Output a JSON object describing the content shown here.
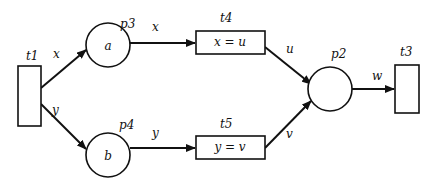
{
  "diagram": {
    "type": "petri-net",
    "transitions": {
      "t1": {
        "label": "t1",
        "guard": ""
      },
      "t3": {
        "label": "t3",
        "guard": ""
      },
      "t4": {
        "label": "t4",
        "guard": "x = u"
      },
      "t5": {
        "label": "t5",
        "guard": "y = v"
      }
    },
    "places": {
      "p2": {
        "label": "p2",
        "token": ""
      },
      "p3": {
        "label": "p3",
        "token": "a"
      },
      "p4": {
        "label": "p4",
        "token": "b"
      }
    },
    "arcs": [
      {
        "from": "t1",
        "to": "p3",
        "label": "x"
      },
      {
        "from": "t1",
        "to": "p4",
        "label": "y"
      },
      {
        "from": "p3",
        "to": "t4",
        "label": "x"
      },
      {
        "from": "p4",
        "to": "t5",
        "label": "y"
      },
      {
        "from": "t4",
        "to": "p2",
        "label": "u"
      },
      {
        "from": "t5",
        "to": "p2",
        "label": "v"
      },
      {
        "from": "p2",
        "to": "t3",
        "label": "w"
      }
    ]
  }
}
